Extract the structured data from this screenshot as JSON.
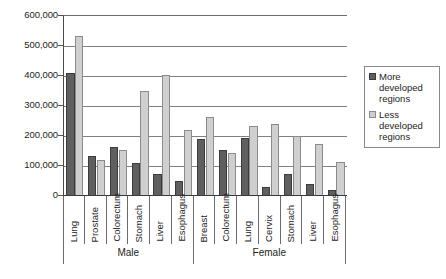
{
  "chart_data": {
    "type": "bar",
    "title": "",
    "subtitle": "",
    "xlabel": "",
    "ylabel": "",
    "ylim": [
      0,
      600000
    ],
    "ytick_labels": [
      "600,000",
      "500,000",
      "400,000",
      "300,000",
      "200,000",
      "100,000",
      "0"
    ],
    "ytick_values": [
      600000,
      500000,
      400000,
      300000,
      200000,
      100000,
      0
    ],
    "grid": true,
    "legend_position": "right",
    "groups": [
      {
        "label": "Male",
        "categories": [
          "Lung",
          "Prostate",
          "Colorectum",
          "Stomach",
          "Liver",
          "Esophagus"
        ]
      },
      {
        "label": "Female",
        "categories": [
          "Breast",
          "Colorectum",
          "Lung",
          "Cervix",
          "Stomach",
          "Liver",
          "Esophagus"
        ]
      }
    ],
    "categories": [
      "Lung",
      "Prostate",
      "Colorectum",
      "Stomach",
      "Liver",
      "Esophagus",
      "Breast",
      "Colorectum",
      "Lung",
      "Cervix",
      "Stomach",
      "Liver",
      "Esophagus"
    ],
    "series": [
      {
        "name": "More developed regions",
        "color": "#5f5f5f",
        "values": [
          410000,
          135000,
          165000,
          110000,
          75000,
          50000,
          190000,
          155000,
          195000,
          30000,
          75000,
          40000,
          20000
        ]
      },
      {
        "name": "Less developed regions",
        "color": "#cfcfcf",
        "values": [
          535000,
          120000,
          152000,
          350000,
          405000,
          220000,
          265000,
          145000,
          235000,
          240000,
          200000,
          175000,
          113000
        ]
      }
    ]
  },
  "legend": {
    "items": [
      {
        "label_line1": "More",
        "label_line2": "developed",
        "label_line3": "regions",
        "swatch": "more"
      },
      {
        "label_line1": "Less",
        "label_line2": "developed",
        "label_line3": "regions",
        "swatch": "less"
      }
    ]
  }
}
